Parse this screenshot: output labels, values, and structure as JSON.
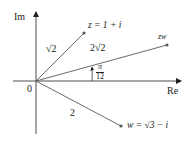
{
  "diagram": {
    "axes": {
      "real_label": "Re",
      "imag_label": "Im",
      "origin_label": "0"
    },
    "points": {
      "z": {
        "label": "z = 1 + i",
        "modulus_label": "√2"
      },
      "zw": {
        "label": "zw",
        "modulus_label": "2√2"
      },
      "w": {
        "label": "w = √3 − i",
        "modulus_label": "2"
      }
    },
    "angle": {
      "numerator": "π",
      "denominator": "12"
    },
    "colors": {
      "axis": "#231f20",
      "vector": "#58595b",
      "text": "#231f20"
    }
  }
}
